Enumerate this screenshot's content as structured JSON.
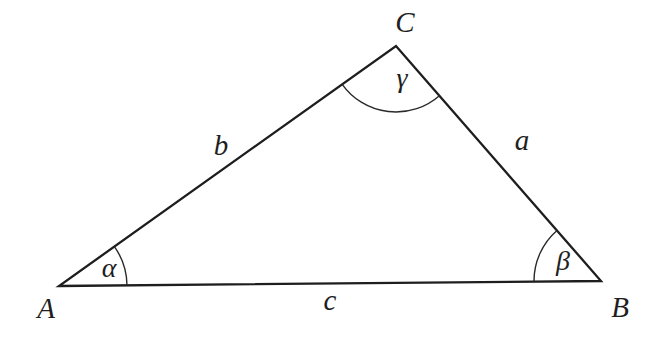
{
  "figure": {
    "width": 657,
    "height": 343,
    "background_color": "#ffffff",
    "line_color": "#1e1e1e",
    "text_color": "#1f1f1f"
  },
  "diagram": {
    "type": "labeled-triangle",
    "vertices": {
      "A": {
        "label": "A",
        "x": 59,
        "y": 286,
        "label_x": 46,
        "label_y": 318
      },
      "B": {
        "label": "B",
        "x": 601,
        "y": 281,
        "label_x": 620,
        "label_y": 317
      },
      "C": {
        "label": "C",
        "x": 396,
        "y": 46,
        "label_x": 405,
        "label_y": 32
      }
    },
    "sides": {
      "a": {
        "label": "a",
        "from": "B",
        "to": "C",
        "label_x": 522,
        "label_y": 150
      },
      "b": {
        "label": "b",
        "from": "A",
        "to": "C",
        "label_x": 221,
        "label_y": 155
      },
      "c": {
        "label": "c",
        "from": "A",
        "to": "B",
        "label_x": 330,
        "label_y": 310
      }
    },
    "angles": {
      "alpha": {
        "label": "α",
        "vertex": "A",
        "between": [
          "B",
          "C"
        ],
        "radius": 68,
        "label_x": 109,
        "label_y": 277
      },
      "beta": {
        "label": "β",
        "vertex": "B",
        "between": [
          "A",
          "C"
        ],
        "radius": 67,
        "label_x": 563,
        "label_y": 270
      },
      "gamma": {
        "label": "γ",
        "vertex": "C",
        "between": [
          "A",
          "B"
        ],
        "radius": 66,
        "label_x": 402,
        "label_y": 87
      }
    }
  }
}
